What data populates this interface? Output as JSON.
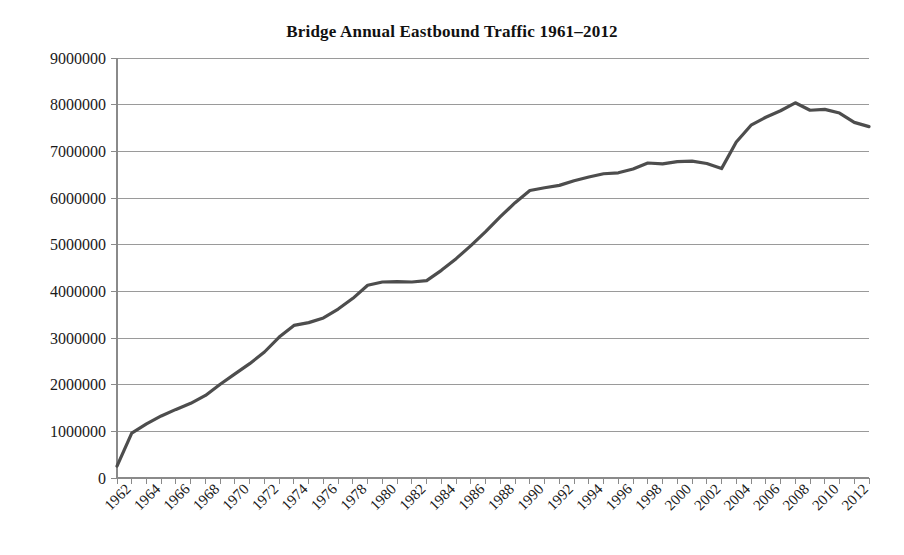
{
  "chart_data": {
    "type": "line",
    "title": "Bridge Annual Eastbound Traffic 1961–2012",
    "xlabel": "",
    "ylabel": "",
    "xlim": [
      1961,
      2012
    ],
    "ylim": [
      0,
      9000000
    ],
    "grid": true,
    "legend": "none",
    "y_ticks": [
      0,
      1000000,
      2000000,
      3000000,
      4000000,
      5000000,
      6000000,
      7000000,
      8000000,
      9000000
    ],
    "y_tick_labels": [
      "0",
      "1000000",
      "2000000",
      "3000000",
      "4000000",
      "5000000",
      "6000000",
      "7000000",
      "8000000",
      "9000000"
    ],
    "x_tick_labels": [
      "1962",
      "1964",
      "1966",
      "1968",
      "1970",
      "1972",
      "1974",
      "1976",
      "1978",
      "1980",
      "1982",
      "1984",
      "1986",
      "1988",
      "1990",
      "1992",
      "1994",
      "1996",
      "1998",
      "2000",
      "2002",
      "2004",
      "2006",
      "2008",
      "2010",
      "2012"
    ],
    "x_tick_label_rotation": -45,
    "x_tick_label_step_years": 2,
    "line_color": "#4d4d4d",
    "line_width": 3.2,
    "series": [
      {
        "name": "Annual Eastbound Traffic",
        "x": [
          1961,
          1962,
          1963,
          1964,
          1965,
          1966,
          1967,
          1968,
          1969,
          1970,
          1971,
          1972,
          1973,
          1974,
          1975,
          1976,
          1977,
          1978,
          1979,
          1980,
          1981,
          1982,
          1983,
          1984,
          1985,
          1986,
          1987,
          1988,
          1989,
          1990,
          1991,
          1992,
          1993,
          1994,
          1995,
          1996,
          1997,
          1998,
          1999,
          2000,
          2001,
          2002,
          2003,
          2004,
          2005,
          2006,
          2007,
          2008,
          2009,
          2010,
          2011,
          2012
        ],
        "values": [
          255000,
          960000,
          1160000,
          1330000,
          1470000,
          1600000,
          1770000,
          2010000,
          2230000,
          2450000,
          2700000,
          3020000,
          3270000,
          3330000,
          3430000,
          3620000,
          3850000,
          4130000,
          4200000,
          4210000,
          4200000,
          4230000,
          4450000,
          4700000,
          4980000,
          5280000,
          5600000,
          5900000,
          6160000,
          6220000,
          6270000,
          6370000,
          6450000,
          6520000,
          6540000,
          6620000,
          6750000,
          6730000,
          6780000,
          6790000,
          6740000,
          6630000,
          7200000,
          7560000,
          7730000,
          7870000,
          8040000,
          7880000,
          7900000,
          7820000,
          7620000,
          7530000
        ]
      }
    ]
  },
  "axes": {
    "plot_left_px": 117,
    "plot_right_px": 869,
    "plot_top_px": 58,
    "plot_bottom_px": 478
  }
}
